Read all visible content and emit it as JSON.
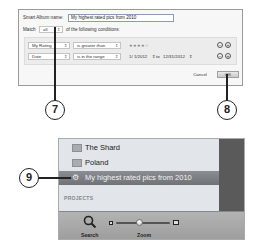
{
  "dialog": {
    "name_label": "Smart Album name:",
    "name_value": "My highest rated pics from 2010",
    "match_label": "Match",
    "match_value": "all",
    "match_suffix": "of the following conditions:",
    "conditions": [
      {
        "field": "My Rating",
        "operator": "is greater than",
        "value": "★★★★☆"
      },
      {
        "field": "Date",
        "operator": "is in the range",
        "from": "1/ 1/2012",
        "to_label": "to",
        "to": "12/31/2012"
      }
    ],
    "remove_glyph": "−",
    "add_glyph": "+",
    "cancel_label": "Cancel",
    "ok_label": "OK"
  },
  "callouts": {
    "c7": "7",
    "c8": "8",
    "c9": "9"
  },
  "sidebar": {
    "items": [
      {
        "label": "The Shard",
        "icon": "folder-icon"
      },
      {
        "label": "Poland",
        "icon": "folder-icon"
      },
      {
        "label": "My highest rated pics from 2010",
        "icon": "gear-icon",
        "selected": true
      }
    ],
    "section_header": "PROJECTS"
  },
  "toolbar": {
    "search_label": "Search",
    "zoom_label": "Zoom"
  }
}
